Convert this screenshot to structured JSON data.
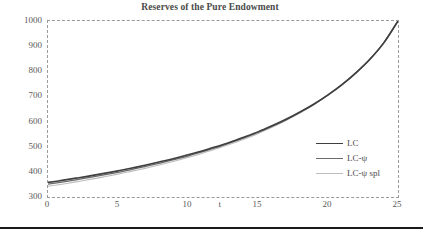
{
  "chart_data": {
    "type": "line",
    "title": "Reserves of the Pure Endowment",
    "xlabel": "t",
    "ylabel": "",
    "xlim": [
      0,
      25
    ],
    "ylim": [
      300,
      1000
    ],
    "grid": false,
    "legend_position": "center-right",
    "plot_border": "dashed",
    "xticks": [
      "0",
      "5",
      "10",
      "15",
      "20",
      "25"
    ],
    "xtick_values": [
      0,
      5,
      10,
      15,
      20,
      25
    ],
    "yticks": [
      "300",
      "400",
      "500",
      "600",
      "700",
      "800",
      "900",
      "1000"
    ],
    "ytick_values": [
      300,
      400,
      500,
      600,
      700,
      800,
      900,
      1000
    ],
    "x": [
      0,
      1,
      2,
      3,
      4,
      5,
      6,
      7,
      8,
      9,
      10,
      11,
      12,
      13,
      14,
      15,
      16,
      17,
      18,
      19,
      20,
      21,
      22,
      23,
      24,
      25
    ],
    "series": [
      {
        "name": "LC",
        "color": "#3f3f3f",
        "width": 1.6,
        "values": [
          358,
          366,
          375,
          384,
          394,
          404,
          415,
          427,
          440,
          453,
          468,
          483,
          500,
          518,
          538,
          559,
          583,
          609,
          638,
          670,
          706,
          747,
          794,
          848,
          914,
          1000
        ]
      },
      {
        "name": "LC-ψ",
        "color": "#6b6b6b",
        "width": 1.3,
        "values": [
          351,
          359,
          368,
          378,
          388,
          398,
          410,
          422,
          435,
          449,
          463,
          479,
          496,
          515,
          535,
          557,
          581,
          607,
          637,
          669,
          706,
          747,
          795,
          849,
          915,
          1000
        ]
      },
      {
        "name": "LC-ψ spl",
        "color": "#bdbdbd",
        "width": 1.1,
        "values": [
          343,
          351,
          360,
          370,
          380,
          391,
          403,
          415,
          428,
          442,
          457,
          473,
          491,
          510,
          530,
          552,
          577,
          604,
          634,
          667,
          704,
          745,
          793,
          848,
          914,
          1000
        ]
      }
    ]
  },
  "legend": {
    "items": [
      {
        "label": "LC"
      },
      {
        "label": "LC-ψ"
      },
      {
        "label": "LC-ψ spl"
      }
    ]
  },
  "colors": {
    "title": "#4a4a4a",
    "tick_label": "#595959",
    "plot_border": "#9a9a9a",
    "background": "#ffffff",
    "bottom_rule": "#1a1a1a"
  }
}
